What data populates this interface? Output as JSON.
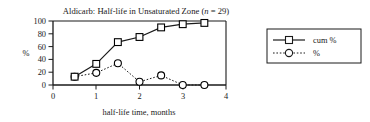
{
  "chart_data": {
    "type": "line",
    "title": "Aldicarb: Half-life in Unsaturated Zone (n = 29)",
    "title_main": "Aldicarb: Half-life in Unsaturated Zone (",
    "title_n_italic": "n",
    "title_tail": " = 29)",
    "xlabel": "half-life time, months",
    "ylabel": "%",
    "x": [
      0.5,
      1,
      1.5,
      2,
      2.5,
      3,
      3.5
    ],
    "xlim": [
      0,
      4
    ],
    "ylim": [
      0,
      100
    ],
    "xticks": [
      "0",
      "1",
      "2",
      "3",
      "4"
    ],
    "xtick_values": [
      0,
      1,
      2,
      3,
      4
    ],
    "yticks": [
      "0",
      "20",
      "40",
      "60",
      "80",
      "100"
    ],
    "ytick_values": [
      0,
      20,
      40,
      60,
      80,
      100
    ],
    "grid": false,
    "legend_position": "right-outside",
    "series": [
      {
        "name": "cum %",
        "values": [
          13,
          33,
          67,
          75,
          90,
          95,
          97
        ],
        "line_style": "solid",
        "marker": "square",
        "color": "#000000"
      },
      {
        "name": "%",
        "values": [
          13,
          19,
          34,
          5,
          15,
          0,
          0
        ],
        "line_style": "dotted",
        "marker": "circle",
        "color": "#000000"
      }
    ]
  },
  "legend": {
    "entries": [
      {
        "label": "cum %"
      },
      {
        "label": "%"
      }
    ]
  }
}
